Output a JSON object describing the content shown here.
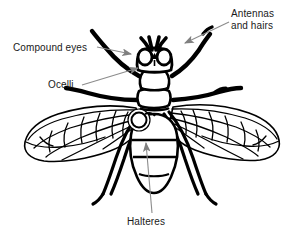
{
  "figure": {
    "view": "dorsal",
    "background_color": "#ffffff",
    "line_color": "#000000",
    "arrow_color": "#808080",
    "leader_line_color": "#8c8c8c",
    "text_color": "#1a1a1a"
  },
  "labels": {
    "antennas": {
      "line1": "Antennas",
      "line2": "and hairs",
      "name": "antennas-and-hairs"
    },
    "compound_eyes": {
      "text": "Compound eyes",
      "name": "compound-eyes"
    },
    "ocelli": {
      "text": "Ocelli",
      "name": "ocelli"
    },
    "halteres": {
      "text": "Halteres",
      "name": "halteres"
    }
  },
  "anatomy": {
    "parts": [
      "head",
      "compound-eye-left",
      "compound-eye-right",
      "ocelli-triangle",
      "antenna-left",
      "antenna-right",
      "thorax-scutum",
      "thorax-scutellum",
      "abdomen",
      "wing-left",
      "wing-right",
      "haltere",
      "leg-foreleg-left",
      "leg-foreleg-right",
      "leg-midleg-left",
      "leg-midleg-right",
      "leg-hindleg-left",
      "leg-hindleg-right"
    ]
  }
}
